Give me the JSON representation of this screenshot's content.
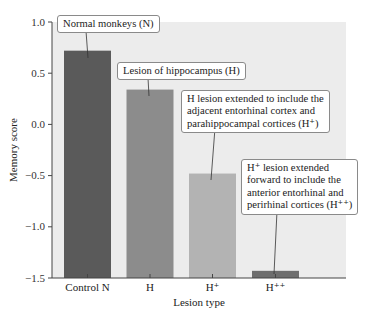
{
  "chart_data": {
    "type": "bar",
    "title": "",
    "xlabel": "Lesion type",
    "ylabel": "Memory score",
    "ylim": [
      -1.5,
      1.0
    ],
    "yticks": [
      1.0,
      0.5,
      0.0,
      -0.5,
      -1.0,
      -1.5
    ],
    "ytick_labels": [
      "1.0",
      "0.5",
      "0.0",
      "−0.5",
      "−1.0",
      "−1.5"
    ],
    "categories": [
      "Control N",
      "H",
      "H⁺",
      "H⁺⁺"
    ],
    "values": [
      0.72,
      0.34,
      -0.48,
      -1.43
    ],
    "bar_colors": [
      "#5a5a5a",
      "#8c8c8c",
      "#b3b3b3",
      "#6e6e6e"
    ],
    "plot_background": "#ececec",
    "grid": false,
    "legend": null,
    "annotations": [
      {
        "target": "Control N",
        "text": [
          "Normal monkeys (N)"
        ]
      },
      {
        "target": "H",
        "text": [
          "Lesion of hippocampus (H)"
        ]
      },
      {
        "target": "H⁺",
        "text": [
          "H lesion extended to include the",
          "adjacent entorhinal cortex and",
          "parahippocampal cortices (H⁺)"
        ]
      },
      {
        "target": "H⁺⁺",
        "text": [
          "H⁺ lesion extended",
          "forward to include the",
          "anterior entorhinal and",
          "perirhinal cortices (H⁺⁺)"
        ]
      }
    ]
  },
  "labels": {
    "xlabel": "Lesion type",
    "ylabel": "Memory score",
    "callout_n": "Normal monkeys (N)",
    "callout_h": "Lesion of hippocampus (H)",
    "callout_hplus": [
      "H lesion extended to include the",
      "adjacent entorhinal cortex and",
      "parahippocampal cortices (H⁺)"
    ],
    "callout_hplusplus": [
      "H⁺ lesion extended",
      "forward to include the",
      "anterior entorhinal and",
      "perirhinal cortices (H⁺⁺)"
    ]
  }
}
